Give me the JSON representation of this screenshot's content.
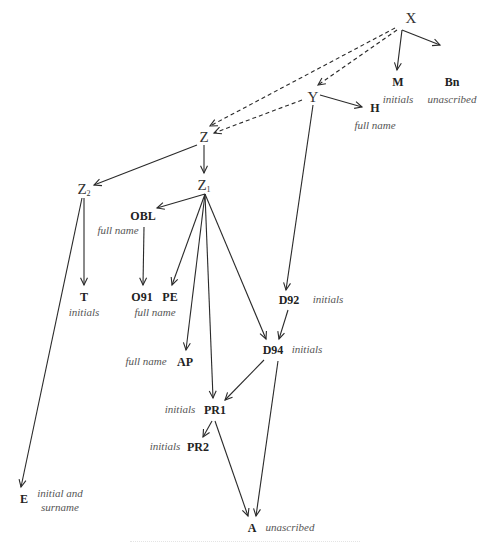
{
  "diagram": {
    "type": "stemma",
    "nodes": [
      {
        "id": "X",
        "label": "X",
        "kind": "hyp",
        "x": 411,
        "y": 18
      },
      {
        "id": "M",
        "label": "M",
        "kind": "wit",
        "x": 398,
        "y": 82
      },
      {
        "id": "Bn",
        "label": "Bn",
        "kind": "wit",
        "x": 452,
        "y": 82
      },
      {
        "id": "Y",
        "label": "Y",
        "kind": "hyp",
        "x": 313,
        "y": 97
      },
      {
        "id": "H",
        "label": "H",
        "kind": "wit",
        "x": 375,
        "y": 108
      },
      {
        "id": "Z",
        "label": "Z",
        "kind": "hyp",
        "x": 204,
        "y": 137
      },
      {
        "id": "Z2",
        "label": "Z",
        "sub": "2",
        "kind": "hyp",
        "x": 84,
        "y": 190
      },
      {
        "id": "Z1",
        "label": "Z",
        "sub": "1",
        "kind": "hyp",
        "x": 204,
        "y": 186
      },
      {
        "id": "OBL",
        "label": "OBL",
        "kind": "wit",
        "x": 143,
        "y": 216
      },
      {
        "id": "T",
        "label": "T",
        "kind": "wit",
        "x": 84,
        "y": 297
      },
      {
        "id": "O91",
        "label": "O91",
        "kind": "wit",
        "x": 142,
        "y": 297
      },
      {
        "id": "PE",
        "label": "PE",
        "kind": "wit",
        "x": 170,
        "y": 297
      },
      {
        "id": "D92",
        "label": "D92",
        "kind": "wit",
        "x": 289,
        "y": 300
      },
      {
        "id": "AP",
        "label": "AP",
        "kind": "wit",
        "x": 185,
        "y": 362
      },
      {
        "id": "D94",
        "label": "D94",
        "kind": "wit",
        "x": 273,
        "y": 350
      },
      {
        "id": "PR1",
        "label": "PR1",
        "kind": "wit",
        "x": 215,
        "y": 410
      },
      {
        "id": "PR2",
        "label": "PR2",
        "kind": "wit",
        "x": 198,
        "y": 447
      },
      {
        "id": "E",
        "label": "E",
        "kind": "wit",
        "x": 24,
        "y": 499
      },
      {
        "id": "A",
        "label": "A",
        "kind": "wit",
        "x": 252,
        "y": 528
      }
    ],
    "annotations": [
      {
        "for": "M",
        "text": "initials",
        "x": 398,
        "y": 100
      },
      {
        "for": "Bn",
        "text": "unascribed",
        "x": 452,
        "y": 100
      },
      {
        "for": "H",
        "text": "full name",
        "x": 375,
        "y": 126
      },
      {
        "for": "OBL",
        "text": "full name",
        "x": 118,
        "y": 231
      },
      {
        "for": "T",
        "text": "initials",
        "x": 84,
        "y": 313
      },
      {
        "for": "O91",
        "text": "full name",
        "x": 155,
        "y": 313
      },
      {
        "for": "D92",
        "text": "initials",
        "x": 328,
        "y": 300
      },
      {
        "for": "AP",
        "text": "full name",
        "x": 146,
        "y": 362
      },
      {
        "for": "D94",
        "text": "initials",
        "x": 307,
        "y": 350
      },
      {
        "for": "PR1",
        "text": "initials",
        "x": 180,
        "y": 410
      },
      {
        "for": "PR2",
        "text": "initials",
        "x": 165,
        "y": 447
      },
      {
        "for": "E",
        "text": "initial and\nsurname",
        "x": 60,
        "y": 501
      },
      {
        "for": "A",
        "text": "unascribed",
        "x": 290,
        "y": 528
      }
    ],
    "edges": [
      {
        "from": "X",
        "to": "M",
        "style": "solid",
        "x1": 402,
        "y1": 30,
        "x2": 397,
        "y2": 70
      },
      {
        "from": "X",
        "to": "Bn",
        "style": "solid",
        "x1": 402,
        "y1": 30,
        "x2": 440,
        "y2": 45
      },
      {
        "from": "X",
        "to": "Y",
        "style": "dashed",
        "x1": 397,
        "y1": 30,
        "x2": 318,
        "y2": 85
      },
      {
        "from": "X",
        "to": "Z",
        "style": "dashed",
        "x1": 395,
        "y1": 28,
        "x2": 210,
        "y2": 126
      },
      {
        "from": "Y",
        "to": "Z",
        "style": "dashed",
        "x1": 302,
        "y1": 100,
        "x2": 214,
        "y2": 133
      },
      {
        "from": "Y",
        "to": "H",
        "style": "solid",
        "x1": 320,
        "y1": 95,
        "x2": 362,
        "y2": 107
      },
      {
        "from": "Y",
        "to": "D92",
        "style": "solid",
        "x1": 313,
        "y1": 105,
        "x2": 286,
        "y2": 290
      },
      {
        "from": "Z",
        "to": "Z2",
        "style": "solid",
        "x1": 197,
        "y1": 145,
        "x2": 94,
        "y2": 185
      },
      {
        "from": "Z",
        "to": "Z1",
        "style": "solid",
        "x1": 204,
        "y1": 145,
        "x2": 204,
        "y2": 173
      },
      {
        "from": "Z1",
        "to": "OBL",
        "style": "solid",
        "x1": 205,
        "y1": 194,
        "x2": 157,
        "y2": 208
      },
      {
        "from": "Z1",
        "to": "PE",
        "style": "solid",
        "x1": 205,
        "y1": 194,
        "x2": 172,
        "y2": 285
      },
      {
        "from": "Z1",
        "to": "AP",
        "style": "solid",
        "x1": 205,
        "y1": 194,
        "x2": 186,
        "y2": 350
      },
      {
        "from": "Z1",
        "to": "PR1",
        "style": "solid",
        "x1": 205,
        "y1": 194,
        "x2": 213,
        "y2": 398
      },
      {
        "from": "Z1",
        "to": "D94",
        "style": "solid",
        "x1": 205,
        "y1": 194,
        "x2": 266,
        "y2": 339
      },
      {
        "from": "Z2",
        "to": "T",
        "style": "solid",
        "x1": 84,
        "y1": 198,
        "x2": 84,
        "y2": 285
      },
      {
        "from": "Z2",
        "to": "E",
        "style": "solid",
        "x1": 82,
        "y1": 198,
        "x2": 21,
        "y2": 487
      },
      {
        "from": "OBL",
        "to": "O91",
        "style": "solid",
        "x1": 144,
        "y1": 227,
        "x2": 143,
        "y2": 285
      },
      {
        "from": "D92",
        "to": "D94",
        "style": "solid",
        "x1": 288,
        "y1": 310,
        "x2": 279,
        "y2": 339
      },
      {
        "from": "D94",
        "to": "PR1",
        "style": "solid",
        "x1": 264,
        "y1": 360,
        "x2": 225,
        "y2": 400
      },
      {
        "from": "D94",
        "to": "A",
        "style": "solid",
        "x1": 278,
        "y1": 361,
        "x2": 256,
        "y2": 516
      },
      {
        "from": "PR1",
        "to": "PR2",
        "style": "solid",
        "x1": 212,
        "y1": 421,
        "x2": 203,
        "y2": 437
      },
      {
        "from": "PR1",
        "to": "A",
        "style": "solid",
        "x1": 215,
        "y1": 421,
        "x2": 248,
        "y2": 516
      }
    ]
  }
}
